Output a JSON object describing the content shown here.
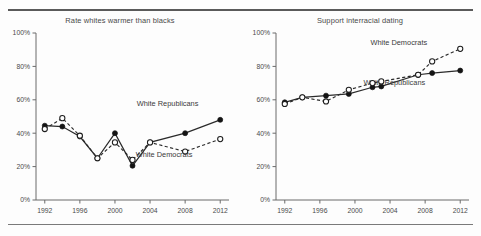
{
  "figure": {
    "background": "#fdfdfd",
    "ink": "#2b2b2b",
    "rule_color": "#6e6e6e"
  },
  "axis": {
    "y_ticks": [
      "0%",
      "20%",
      "40%",
      "60%",
      "80%",
      "100%"
    ],
    "y_values": [
      0,
      20,
      40,
      60,
      80,
      100
    ],
    "x_ticks": [
      "1992",
      "1996",
      "2000",
      "2004",
      "2008",
      "2012"
    ],
    "x_values": [
      1992,
      1996,
      2000,
      2004,
      2008,
      2012
    ],
    "xlim": [
      1991,
      2013
    ],
    "ylim": [
      0,
      100
    ]
  },
  "chart_data": [
    {
      "type": "line",
      "title": "Rate whites warmer than blacks",
      "xlabel": "",
      "ylabel": "",
      "xlim": [
        1991,
        2013
      ],
      "ylim": [
        0,
        100
      ],
      "grid": false,
      "legend": "inline-annotations",
      "x": [
        1992,
        1994,
        1996,
        1998,
        2000,
        2002,
        2004,
        2008,
        2012
      ],
      "series": [
        {
          "name": "White Republicans",
          "style": "solid",
          "marker": "filled-circle",
          "label_x": 2006.0,
          "label_y": 56,
          "values": [
            44.5,
            44.0,
            38.0,
            25.0,
            40.0,
            20.5,
            34.5,
            40.0,
            48.0
          ]
        },
        {
          "name": "White Democrats",
          "style": "dashed",
          "marker": "open-circle",
          "label_x": 2005.6,
          "label_y": 26,
          "values": [
            42.5,
            49.0,
            38.5,
            25.0,
            34.5,
            24.0,
            34.5,
            29.0,
            36.5
          ]
        }
      ]
    },
    {
      "type": "line",
      "title": "Support interracial dating",
      "xlabel": "",
      "ylabel": "",
      "xlim": [
        1991,
        2013
      ],
      "ylim": [
        0,
        100
      ],
      "grid": false,
      "legend": "inline-annotations",
      "series": [
        {
          "name": "White Republicans",
          "style": "solid",
          "marker": "filled-circle",
          "label_x": 2004.5,
          "label_y": 69,
          "x": [
            1992,
            1994,
            1996.7,
            1999.3,
            2002,
            2003,
            2007.2,
            2008.8,
            2012
          ],
          "values": [
            58.5,
            61.5,
            62.5,
            63.5,
            67.5,
            68.0,
            75.0,
            76.0,
            77.5
          ]
        },
        {
          "name": "White Democrats",
          "style": "dashed",
          "marker": "open-circle",
          "label_x": 2005.0,
          "label_y": 93,
          "x": [
            1992,
            1994,
            1996.7,
            1999.3,
            2002,
            2003,
            2007.2,
            2008.8,
            2012
          ],
          "values": [
            57.5,
            61.5,
            59.0,
            66.0,
            70.0,
            71.0,
            75.0,
            83.0,
            90.5
          ]
        }
      ]
    }
  ]
}
